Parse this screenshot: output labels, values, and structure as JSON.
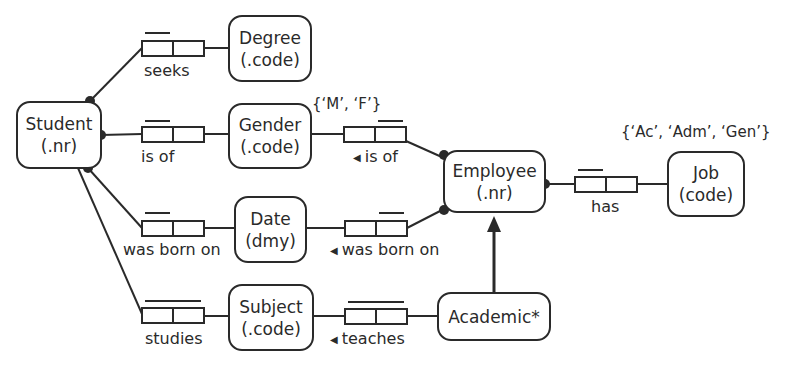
{
  "entities": {
    "student": {
      "name": "Student",
      "ref": "(.nr)"
    },
    "degree": {
      "name": "Degree",
      "ref": "(.code)"
    },
    "gender": {
      "name": "Gender",
      "ref": "(.code)"
    },
    "date": {
      "name": "Date",
      "ref": "(dmy)"
    },
    "subject": {
      "name": "Subject",
      "ref": "(.code)"
    },
    "employee": {
      "name": "Employee",
      "ref": "(.nr)"
    },
    "job": {
      "name": "Job",
      "ref": "(code)"
    },
    "academic": {
      "name": "Academic*"
    }
  },
  "facts": {
    "student_seeks_degree": {
      "reading": "seeks"
    },
    "student_is_of_gender": {
      "reading": "is of"
    },
    "student_born_on_date": {
      "reading": "was born on"
    },
    "student_studies_subject": {
      "reading": "studies"
    },
    "employee_is_of_gender": {
      "reading": "is of",
      "inverse_marker": "◀"
    },
    "employee_born_on_date": {
      "reading": "was born on",
      "inverse_marker": "◀"
    },
    "academic_teaches_subject": {
      "reading": "teaches",
      "inverse_marker": "◀"
    },
    "employee_has_job": {
      "reading": "has"
    }
  },
  "value_constraints": {
    "gender": "{‘M’, ‘F’}",
    "job": "{‘Ac’, ‘Adm’, ‘Gen’}"
  },
  "colors": {
    "stroke": "#2a2a2a",
    "background": "#ffffff"
  }
}
